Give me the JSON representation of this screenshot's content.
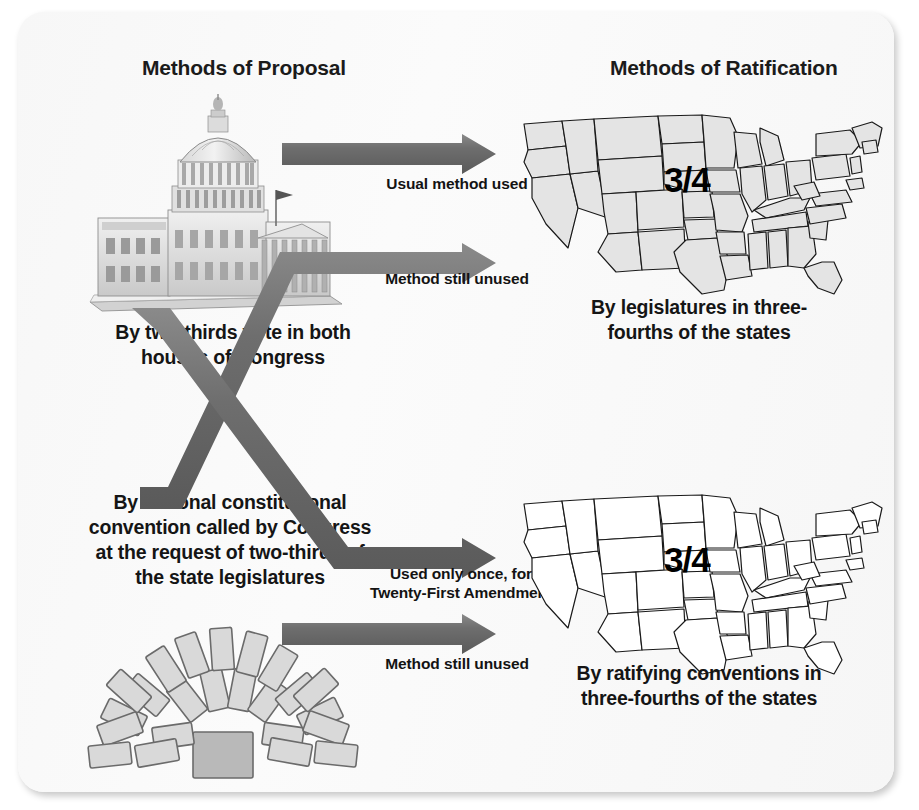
{
  "diagram": {
    "columns": {
      "proposal_title": "Methods of Proposal",
      "ratification_title": "Methods of Ratification"
    },
    "proposal_methods": [
      {
        "id": "congress",
        "caption": "By two-thirds vote in both houses of Congress",
        "icon": "capitol-building-illustration"
      },
      {
        "id": "convention",
        "caption": "By national constitutional convention called by Congress at the request of two-thirds of the state legislatures",
        "icon": "convention-assembly-seating-illustration"
      }
    ],
    "ratification_methods": [
      {
        "id": "legislatures",
        "caption": "By legislatures in three-fourths of the states",
        "fraction": "3/4",
        "icon": "us-map-shaded"
      },
      {
        "id": "ratifying-conventions",
        "caption": "By ratifying conventions in three-fourths of the states",
        "fraction": "3/4",
        "icon": "us-map-outline"
      }
    ],
    "arrows": [
      {
        "id": "congress-to-legislatures",
        "label": "Usual method used"
      },
      {
        "id": "congress-to-conventions",
        "label": "Used only once, for Twenty-First Amendment"
      },
      {
        "id": "convention-to-legislatures",
        "label": "Method still unused"
      },
      {
        "id": "convention-to-conventions",
        "label": "Method still unused"
      }
    ],
    "colors": {
      "arrow": "#6e6e6e",
      "arrow_dark": "#5c5c5c",
      "text": "#151515",
      "card_background": "#fbfbfb",
      "map_fill_shaded": "#e4e4e4",
      "map_fill_outline": "#ffffff",
      "map_stroke": "#1a1a1a",
      "seat_fill": "#d9d9d9",
      "seat_stroke": "#6b6b6b"
    }
  }
}
